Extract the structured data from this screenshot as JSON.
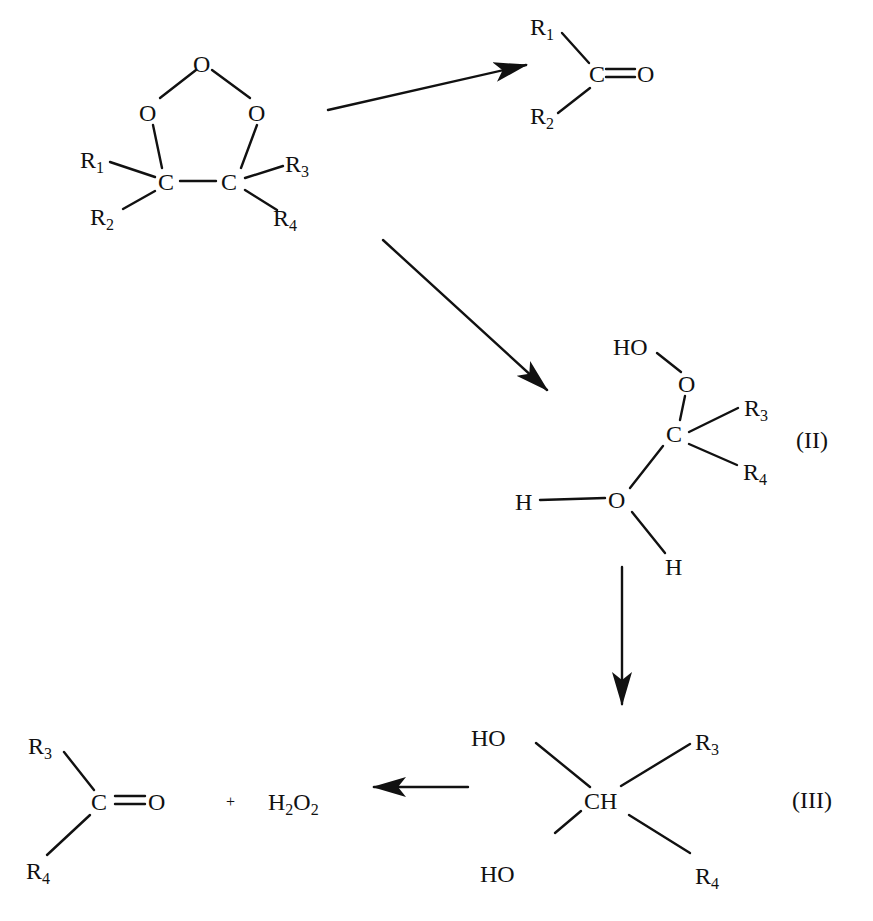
{
  "diagram": {
    "type": "reaction-scheme",
    "colors": {
      "ink": "#111111",
      "background": "#ffffff"
    },
    "ozonide": {
      "atoms": {
        "O_top": "O",
        "O_left": "O",
        "O_right": "O",
        "C_left": "C",
        "C_right": "C"
      },
      "substituents": {
        "r1": "R",
        "r1_sub": "1",
        "r2": "R",
        "r2_sub": "2",
        "r3": "R",
        "r3_sub": "3",
        "r4": "R",
        "r4_sub": "4"
      }
    },
    "product_top": {
      "carbon": "C",
      "oxygen": "O",
      "r1": "R",
      "r1_sub": "1",
      "r2": "R",
      "r2_sub": "2"
    },
    "intermediate_II": {
      "label": "(II)",
      "ho": "HO",
      "o_peroxy": "O",
      "carbon": "C",
      "r3": "R",
      "r3_sub": "3",
      "r4": "R",
      "r4_sub": "4",
      "h_left": "H",
      "o_water": "O",
      "h_bottom": "H"
    },
    "intermediate_III": {
      "label": "(III)",
      "center": "CH",
      "ho_top": "HO",
      "ho_bottom": "HO",
      "r3": "R",
      "r3_sub": "3",
      "r4": "R",
      "r4_sub": "4"
    },
    "product_bottom": {
      "carbon": "C",
      "oxygen": "O",
      "r3": "R",
      "r3_sub": "3",
      "r4": "R",
      "r4_sub": "4",
      "plus": "+",
      "h2o2_h": "H",
      "h2o2_h_sub": "2",
      "h2o2_o": "O",
      "h2o2_o_sub": "2"
    },
    "arrows": [
      {
        "name": "ozonide-to-carbonyl",
        "direction": "right"
      },
      {
        "name": "ozonide-to-II",
        "direction": "down-right"
      },
      {
        "name": "II-to-III",
        "direction": "down"
      },
      {
        "name": "III-to-products",
        "direction": "left"
      }
    ]
  }
}
